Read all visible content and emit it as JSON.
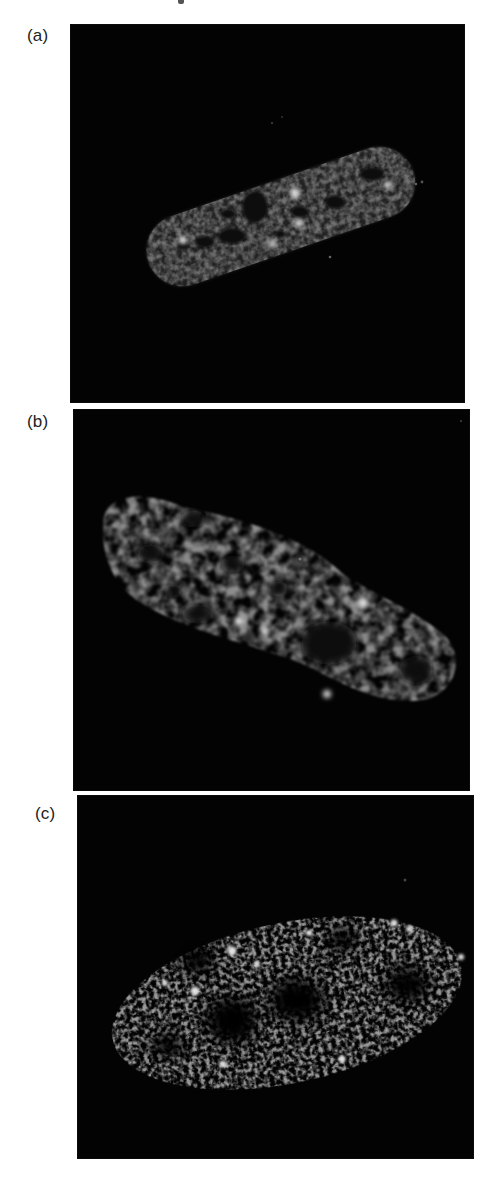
{
  "figure": {
    "panels": [
      {
        "id": "a",
        "label": "(a)",
        "content": "fluorescence micrograph of an elongated cell nucleus, uniform granular gray staining with dark voids and a few bright foci",
        "box": {
          "x": 70,
          "y": 24,
          "w": 395,
          "h": 379
        },
        "label_pos": {
          "x": 27,
          "y": 27
        }
      },
      {
        "id": "b",
        "label": "(b)",
        "content": "fluorescence micrograph of a larger oval nucleus with mottled gray staining, several dark nucleolar regions and bright spots",
        "box": {
          "x": 73,
          "y": 409,
          "w": 397,
          "h": 382
        },
        "label_pos": {
          "x": 27,
          "y": 413
        }
      },
      {
        "id": "c",
        "label": "(c)",
        "content": "fluorescence micrograph of a nucleus with sparse punctate speckled staining and dark unstained regions",
        "box": {
          "x": 77,
          "y": 795,
          "w": 397,
          "h": 364
        },
        "label_pos": {
          "x": 35,
          "y": 805
        }
      }
    ]
  },
  "colors": {
    "background": "#ffffff",
    "panel_bg": "#030303",
    "nucleus_gray": "#8a8a8a",
    "nucleus_dark": "#2a2a2a",
    "bright_focus": "#d8d8d8",
    "label": "#222222"
  }
}
